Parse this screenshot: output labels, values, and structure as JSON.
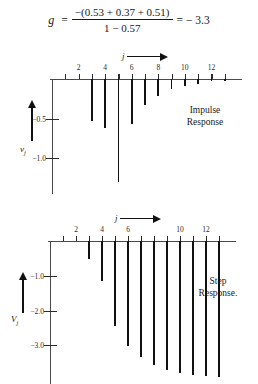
{
  "formula": {
    "variable": "g",
    "equals": "=",
    "numerator": "−(0.53 + 0.37 + 0.51)",
    "denominator": "1 − 0.57",
    "result": "= − 3.3"
  },
  "charts": [
    {
      "id": "impulse-response",
      "caption_line1": "Impulse",
      "caption_line2": "Response",
      "x_axis_label": "j",
      "y_axis_label": "v",
      "y_axis_sub": "j",
      "x_ticks": [
        1,
        2,
        3,
        4,
        5,
        6,
        7,
        8,
        9,
        10,
        11,
        12,
        13
      ],
      "x_tick_labels": [
        {
          "value": 2,
          "label": "2"
        },
        {
          "value": 4,
          "label": "4"
        },
        {
          "value": 6,
          "label": "6"
        },
        {
          "value": 8,
          "label": "8"
        },
        {
          "value": 10,
          "label": "10"
        },
        {
          "value": 12,
          "label": "12"
        }
      ],
      "y_tick_labels": [
        {
          "value": -0.5,
          "label": "−0.5"
        },
        {
          "value": -1.0,
          "label": "−1.0"
        }
      ],
      "chart_data": {
        "type": "bar",
        "title": "Impulse Response",
        "xlabel": "j",
        "ylabel": "v_j",
        "categories": [
          1,
          2,
          3,
          4,
          5,
          6,
          7,
          8,
          9,
          10,
          11,
          12,
          13
        ],
        "values": [
          0,
          0,
          -0.53,
          -0.62,
          -1.3,
          -0.57,
          -0.33,
          -0.22,
          -0.13,
          -0.09,
          -0.06,
          -0.03,
          -0.02
        ],
        "ylim": [
          -1.4,
          0
        ],
        "xlim": [
          0,
          14
        ],
        "grid": false,
        "legend": null
      }
    },
    {
      "id": "step-response",
      "caption_line1": "Step",
      "caption_line2": "Response.",
      "x_axis_label": "j",
      "y_axis_label": "V",
      "y_axis_sub": "j",
      "x_ticks": [
        1,
        2,
        3,
        4,
        5,
        6,
        7,
        8,
        9,
        10,
        11,
        12,
        13
      ],
      "x_tick_labels": [
        {
          "value": 2,
          "label": "2"
        },
        {
          "value": 4,
          "label": "4"
        },
        {
          "value": 6,
          "label": "6"
        },
        {
          "value": 10,
          "label": "10"
        },
        {
          "value": 12,
          "label": "12"
        }
      ],
      "y_tick_labels": [
        {
          "value": -1.0,
          "label": "−1.0"
        },
        {
          "value": -2.0,
          "label": "−2.0"
        },
        {
          "value": -3.0,
          "label": "−3.0"
        }
      ],
      "chart_data": {
        "type": "bar",
        "title": "Step Response",
        "xlabel": "j",
        "ylabel": "V_j",
        "categories": [
          1,
          2,
          3,
          4,
          5,
          6,
          7,
          8,
          9,
          10,
          11,
          12,
          13
        ],
        "values": [
          0,
          0,
          -0.53,
          -1.15,
          -2.45,
          -3.02,
          -3.35,
          -3.57,
          -3.7,
          -3.79,
          -3.85,
          -3.88,
          -3.9
        ],
        "ylim": [
          -4.0,
          0
        ],
        "xlim": [
          0,
          14
        ],
        "grid": false,
        "legend": null
      }
    }
  ]
}
